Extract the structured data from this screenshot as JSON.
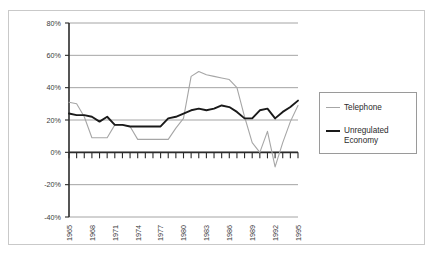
{
  "chart_data": {
    "type": "line",
    "title": "",
    "xlabel": "",
    "ylabel": "",
    "grid": true,
    "legend_position": "right",
    "ylim": [
      -40,
      80
    ],
    "ytick_labels": [
      "80%",
      "60%",
      "40%",
      "20%",
      "0%",
      "-20%",
      "-40%"
    ],
    "ytick_values": [
      80,
      60,
      40,
      20,
      0,
      -20,
      -40
    ],
    "xlim": [
      1965,
      1995
    ],
    "xtick_labels": [
      "1965",
      "1968",
      "1971",
      "1974",
      "1977",
      "1980",
      "1983",
      "1986",
      "1989",
      "1992",
      "1995"
    ],
    "xtick_values": [
      1965,
      1968,
      1971,
      1974,
      1977,
      1980,
      1983,
      1986,
      1989,
      1992,
      1995
    ],
    "x": [
      1965,
      1966,
      1967,
      1968,
      1969,
      1970,
      1971,
      1972,
      1973,
      1974,
      1975,
      1976,
      1977,
      1978,
      1979,
      1980,
      1981,
      1982,
      1983,
      1984,
      1985,
      1986,
      1987,
      1988,
      1989,
      1990,
      1991,
      1992,
      1993,
      1994,
      1995
    ],
    "series": [
      {
        "name": "Telephone",
        "color": "#a6a6a6",
        "values": [
          31,
          30,
          22,
          9,
          9,
          9,
          17,
          17,
          16,
          8,
          8,
          8,
          8,
          8,
          15,
          21,
          47,
          50,
          48,
          47,
          46,
          45,
          40,
          22,
          6,
          0,
          13,
          -9,
          6,
          19,
          29
        ]
      },
      {
        "name": "Unregulated Economy",
        "color": "#1a1a1a",
        "values": [
          24,
          23,
          23,
          22,
          19,
          22,
          17,
          17,
          16,
          16,
          16,
          16,
          16,
          21,
          22,
          24,
          26,
          27,
          26,
          27,
          29,
          28,
          25,
          21,
          21,
          26,
          27,
          21,
          25,
          28,
          32
        ]
      }
    ]
  },
  "legend": {
    "items": [
      {
        "label": "Telephone"
      },
      {
        "label": "Unregulated\nEconomy"
      }
    ]
  }
}
